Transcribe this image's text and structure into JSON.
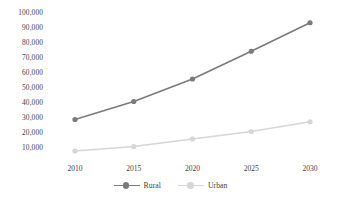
{
  "chart_data": {
    "type": "line",
    "title": "",
    "subtitle": "",
    "xlabel": "",
    "ylabel": "",
    "categories": [
      "2010",
      "2015",
      "2020",
      "2025",
      "2030"
    ],
    "x": [
      2010,
      2015,
      2020,
      2025,
      2030
    ],
    "series": [
      {
        "name": "Rural",
        "color": "#7b7b7b",
        "marker": "circle",
        "values": [
          29000,
          41000,
          56000,
          74500,
          93500
        ]
      },
      {
        "name": "Urban",
        "color": "#d6d6d6",
        "marker": "circle",
        "values": [
          8000,
          11000,
          16000,
          21000,
          27500
        ]
      }
    ],
    "ylim": [
      0,
      100000
    ],
    "yticks": [
      10000,
      20000,
      30000,
      40000,
      50000,
      60000,
      70000,
      80000,
      90000,
      100000
    ],
    "ytick_labels": [
      "10,000",
      "20,000",
      "30,000",
      "40,000",
      "50,000",
      "60,000",
      "70,000",
      "80,000",
      "90,000",
      "100,000"
    ],
    "xticks": [
      2010,
      2015,
      2020,
      2025,
      2030
    ],
    "xtick_labels": [
      "2010",
      "2015",
      "2020",
      "2025",
      "2030"
    ],
    "grid": false,
    "axis_lines": false,
    "legend_position": "bottom-center",
    "legend": [
      "Rural",
      "Urban"
    ],
    "annotations": []
  },
  "axes": {
    "y_ticks": [
      {
        "label": "100,000",
        "value": 100000
      },
      {
        "label": "90,000",
        "value": 90000
      },
      {
        "label": "80,000",
        "value": 80000
      },
      {
        "label": "70,000",
        "value": 70000
      },
      {
        "label": "60,000",
        "value": 60000
      },
      {
        "label": "50,000",
        "value": 50000
      },
      {
        "label": "40,000",
        "value": 40000
      },
      {
        "label": "30,000",
        "value": 30000
      },
      {
        "label": "20,000",
        "value": 20000
      },
      {
        "label": "10,000",
        "value": 10000
      }
    ],
    "x_ticks": [
      {
        "label": "2010",
        "value": 2010
      },
      {
        "label": "2015",
        "value": 2015
      },
      {
        "label": "2020",
        "value": 2020
      },
      {
        "label": "2025",
        "value": 2025
      },
      {
        "label": "2030",
        "value": 2030
      }
    ]
  },
  "legend": {
    "items": [
      {
        "label": "Rural",
        "color": "#7b7b7b"
      },
      {
        "label": "Urban",
        "color": "#d6d6d6"
      }
    ]
  },
  "colors": {
    "rural": "#7b7b7b",
    "urban": "#d6d6d6",
    "text": "#3f3f3f",
    "background": "#ffffff"
  }
}
